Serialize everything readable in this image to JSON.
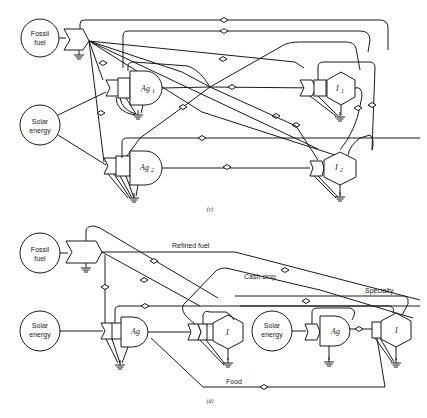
{
  "diagram_c": {
    "caption": "(c)",
    "sources": {
      "fossil": [
        "Fossil",
        "fuel"
      ],
      "solar": [
        "Solar",
        "energy"
      ]
    },
    "nodes": {
      "ag1": "Ag",
      "ag1_sub": "1",
      "ag2": "Ag",
      "ag2_sub": "2",
      "i1": "I",
      "i1_sub": "1",
      "i2": "I",
      "i2_sub": "2"
    }
  },
  "diagram_d": {
    "caption": "(d)",
    "sources": {
      "fossil": [
        "Fossil",
        "fuel"
      ],
      "solar_left": [
        "Solar",
        "energy"
      ],
      "solar_right": [
        "Solar",
        "energy"
      ]
    },
    "nodes": {
      "ag_left": "Ag",
      "i_left": "I",
      "ag_right": "Ag",
      "i_right": "I"
    },
    "flow_labels": {
      "refined_fuel": "Refined fuel",
      "cash_crop": "Cash crop",
      "specialty": "Specialty",
      "food": "Food"
    }
  }
}
